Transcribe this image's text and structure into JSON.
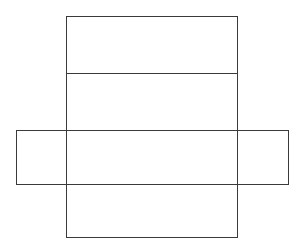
{
  "diagram": {
    "type": "rectangular-prism-net",
    "background": "#ffffff",
    "stroke": "#3a3a3a",
    "stroke_width": 1,
    "faces": [
      {
        "name": "top-face",
        "x": 66,
        "y": 16,
        "w": 171,
        "h": 57
      },
      {
        "name": "back-face",
        "x": 66,
        "y": 73,
        "w": 171,
        "h": 57
      },
      {
        "name": "bottom-face",
        "x": 66,
        "y": 130,
        "w": 171,
        "h": 54
      },
      {
        "name": "front-face",
        "x": 66,
        "y": 184,
        "w": 171,
        "h": 53
      },
      {
        "name": "left-side-face",
        "x": 16,
        "y": 130,
        "w": 50,
        "h": 54
      },
      {
        "name": "right-side-face",
        "x": 237,
        "y": 130,
        "w": 51,
        "h": 54
      }
    ]
  }
}
